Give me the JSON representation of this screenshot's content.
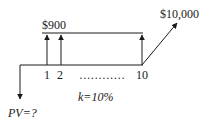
{
  "diagram": {
    "type": "cash-flow timeline",
    "payment_label": "$900",
    "future_value_label": "$10,000",
    "present_value_label": "PV=?",
    "rate_label": "k=10%",
    "period_labels": [
      "1",
      "2",
      "10"
    ],
    "ellipsis": "…………",
    "colors": {
      "stroke": "#1a1a1a",
      "background": "#ffffff"
    }
  }
}
